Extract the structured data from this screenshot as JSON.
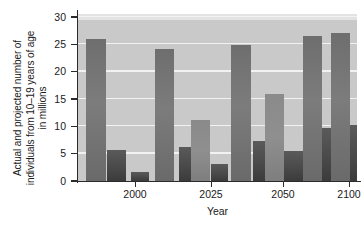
{
  "chart_data": {
    "type": "bar",
    "title": "",
    "xlabel": "Year",
    "ylabel": "Actual and projected number of individuals from 10–19 years of age in millions",
    "ylabel_lines": [
      "Actual and projected number of",
      "individuals from 10–19 years of age",
      "in millions"
    ],
    "ylim": [
      0,
      30
    ],
    "ytick_values": [
      0,
      5,
      10,
      15,
      20,
      25,
      30
    ],
    "ytick_labels": [
      "0",
      "5",
      "10",
      "15",
      "20",
      "25",
      "30"
    ],
    "xtick_labels": [
      "2000",
      "2025",
      "2050",
      "2100"
    ],
    "grid": true,
    "legend": "none",
    "categories": [
      "2000-a",
      "2000-b",
      "2000-c",
      "2025-a",
      "2025-b",
      "2025-c",
      "2025-d",
      "2050-a",
      "2050-b",
      "2050-c",
      "2050-d",
      "2100-a",
      "2100-b",
      "2100-c",
      "2100-d"
    ],
    "values": [
      26.0,
      5.7,
      1.7,
      24.2,
      6.3,
      11.1,
      3.2,
      24.8,
      7.4,
      16.0,
      5.4,
      26.6,
      9.7,
      27.0,
      10.3
    ],
    "bars": [
      {
        "name": "bar-1",
        "value": 26.0,
        "x": 8,
        "width": 20,
        "shade": "plain"
      },
      {
        "name": "bar-2",
        "value": 5.7,
        "x": 29,
        "width": 19,
        "shade": "dark"
      },
      {
        "name": "bar-3",
        "value": 1.7,
        "x": 53,
        "width": 18,
        "shade": "dark"
      },
      {
        "name": "bar-4",
        "value": 24.2,
        "x": 77,
        "width": 19,
        "shade": "plain"
      },
      {
        "name": "bar-5",
        "value": 6.3,
        "x": 101,
        "width": 12,
        "shade": "dark"
      },
      {
        "name": "bar-6",
        "value": 11.1,
        "x": 113,
        "width": 19,
        "shade": "mid"
      },
      {
        "name": "bar-7",
        "value": 3.2,
        "x": 133,
        "width": 17,
        "shade": "dark"
      },
      {
        "name": "bar-8",
        "value": 24.8,
        "x": 153,
        "width": 20,
        "shade": "plain"
      },
      {
        "name": "bar-9",
        "value": 7.4,
        "x": 175,
        "width": 12,
        "shade": "dark"
      },
      {
        "name": "bar-10",
        "value": 16.0,
        "x": 187,
        "width": 19,
        "shade": "mid"
      },
      {
        "name": "bar-11",
        "value": 5.4,
        "x": 206,
        "width": 19,
        "shade": "dark"
      },
      {
        "name": "bar-12",
        "value": 26.6,
        "x": 225,
        "width": 19,
        "shade": "plain"
      },
      {
        "name": "bar-13",
        "value": 9.7,
        "x": 244,
        "width": 19,
        "shade": "dark"
      },
      {
        "name": "bar-14",
        "value": 27.0,
        "x": 253,
        "width": 19,
        "shade": "plain"
      },
      {
        "name": "bar-15",
        "value": 10.3,
        "x": 272,
        "width": 19,
        "shade": "dark"
      }
    ],
    "xtick_positions": [
      57,
      133,
      205,
      271
    ],
    "colors": {
      "plot_background": "#c9c9c9",
      "gridline": "#f2f2f2",
      "bar_plain": "#7c7c7c",
      "bar_dark": "#4a4a4a",
      "bar_mid": "#8a8a8a",
      "axis": "#2b2b2b",
      "text": "#1a1a1a"
    }
  }
}
